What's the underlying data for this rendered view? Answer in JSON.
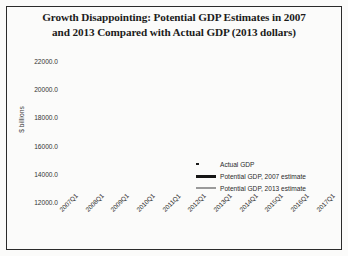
{
  "figure": {
    "title_line1": "Growth Disappointing: Potential GDP Estimates in 2007",
    "title_line2": "and 2013 Compared with Actual GDP (2013 dollars)"
  },
  "legend": {
    "items": [
      {
        "label": "Actual GDP",
        "style": "dotted",
        "color": "#1a1a1a"
      },
      {
        "label": "Potential GDP, 2007 estimate",
        "style": "solid-thick",
        "color": "#151515"
      },
      {
        "label": "Potential GDP, 2013 estimate",
        "style": "solid-thin",
        "color": "#9a9a9a"
      }
    ]
  },
  "chart_data": {
    "type": "line",
    "title": "Growth Disappointing: Potential GDP Estimates in 2007 and 2013 Compared with Actual GDP (2013 dollars)",
    "xlabel": "",
    "ylabel": "$ billions",
    "ylim": [
      12000,
      22000
    ],
    "yticks": [
      12000,
      14000,
      16000,
      18000,
      20000,
      22000
    ],
    "ytick_labels": [
      "12000.0",
      "14000.0",
      "16000.0",
      "18000.0",
      "20000.0",
      "22000.0"
    ],
    "xticks": [
      "2007Q1",
      "2008Q1",
      "2009Q1",
      "2010Q1",
      "2011Q1",
      "2012Q1",
      "2013Q1",
      "2014Q1",
      "2015Q1",
      "2016Q1",
      "2017Q1"
    ],
    "xlim": [
      "2007Q1",
      "2017Q1"
    ],
    "grid": false,
    "legend_position": "lower right",
    "series": [
      {
        "name": "Actual GDP",
        "style": "dotted",
        "color": "#1a1a1a",
        "x": [
          "2007Q1",
          "2007Q2",
          "2007Q3",
          "2007Q4",
          "2008Q1",
          "2008Q2",
          "2008Q3",
          "2008Q4",
          "2009Q1",
          "2009Q2",
          "2009Q3",
          "2009Q4",
          "2010Q1",
          "2010Q2",
          "2010Q3",
          "2010Q4",
          "2011Q1",
          "2011Q2",
          "2011Q3",
          "2011Q4",
          "2012Q1",
          "2012Q2",
          "2012Q3",
          "2012Q4",
          "2013Q1",
          "2013Q2",
          "2013Q3",
          "2013Q4",
          "2014Q1"
        ],
        "values": [
          15750,
          15840,
          15960,
          15990,
          15900,
          15960,
          15850,
          15600,
          15350,
          15250,
          15280,
          15400,
          15500,
          15600,
          15640,
          15760,
          15800,
          15840,
          15900,
          16020,
          16080,
          16130,
          16210,
          16230,
          16320,
          16420,
          16570,
          16710,
          16700
        ]
      },
      {
        "name": "Potential GDP, 2007 estimate",
        "style": "solid-thick",
        "color": "#151515",
        "x": [
          "2007Q1",
          "2009Q1",
          "2011Q1",
          "2013Q1",
          "2015Q1",
          "2017Q1"
        ],
        "values": [
          15780,
          16500,
          17570,
          18640,
          19700,
          20780
        ]
      },
      {
        "name": "Potential GDP, 2013 estimate",
        "style": "solid-thin",
        "color": "#9a9a9a",
        "x": [
          "2007Q1",
          "2009Q1",
          "2011Q1",
          "2013Q1",
          "2015Q1",
          "2017Q1"
        ],
        "values": [
          15780,
          16420,
          17080,
          17740,
          18400,
          19080
        ]
      }
    ]
  }
}
